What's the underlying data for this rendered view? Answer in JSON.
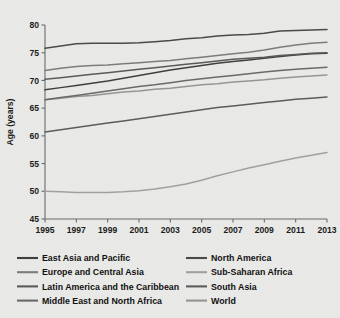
{
  "chart_data": {
    "type": "line",
    "title": "",
    "subtitle": "",
    "xlabel": "",
    "ylabel": "Age (years)",
    "xlim": [
      1995,
      2013
    ],
    "ylim": [
      45,
      80
    ],
    "y_ticks": [
      45,
      50,
      55,
      60,
      65,
      70,
      75,
      80
    ],
    "x_ticks": [
      1995,
      1996,
      1997,
      1998,
      1999,
      2000,
      2001,
      2002,
      2003,
      2004,
      2005,
      2006,
      2007,
      2008,
      2009,
      2010,
      2011,
      2012,
      2013
    ],
    "x_tick_labels": [
      "1995",
      "1997",
      "1999",
      "2001",
      "2003",
      "2005",
      "2007",
      "2009",
      "2011",
      "2013"
    ],
    "x_tick_labeled_values": [
      1995,
      1997,
      1999,
      2001,
      2003,
      2005,
      2007,
      2009,
      2011,
      2013
    ],
    "grid": false,
    "legend_position": "bottom",
    "legend_columns": 2,
    "x": [
      1995,
      1996,
      1997,
      1998,
      1999,
      2000,
      2001,
      2002,
      2003,
      2004,
      2005,
      2006,
      2007,
      2008,
      2009,
      2010,
      2011,
      2012,
      2013
    ],
    "series": [
      {
        "name": "East Asia and Pacific",
        "color": "#3f3f3f",
        "values": [
          68.3,
          68.7,
          69.1,
          69.5,
          69.9,
          70.4,
          70.9,
          71.4,
          71.9,
          72.3,
          72.7,
          73.1,
          73.4,
          73.7,
          74.0,
          74.3,
          74.6,
          74.8,
          74.9
        ]
      },
      {
        "name": "Europe and Central Asia",
        "color": "#7c7c7c",
        "values": [
          71.8,
          72.2,
          72.5,
          72.7,
          72.8,
          73.0,
          73.2,
          73.4,
          73.6,
          73.9,
          74.2,
          74.5,
          74.8,
          75.1,
          75.5,
          76.0,
          76.4,
          76.7,
          76.9
        ]
      },
      {
        "name": "Latin America and the Caribbean",
        "color": "#5a5a5a",
        "values": [
          70.2,
          70.5,
          70.8,
          71.1,
          71.4,
          71.7,
          72.0,
          72.3,
          72.6,
          72.9,
          73.2,
          73.5,
          73.8,
          74.0,
          74.2,
          74.5,
          74.7,
          74.9,
          75.0
        ]
      },
      {
        "name": "Middle East and North Africa",
        "color": "#6a6a6a",
        "values": [
          66.5,
          66.9,
          67.3,
          67.7,
          68.1,
          68.5,
          68.9,
          69.2,
          69.6,
          70.0,
          70.3,
          70.6,
          70.9,
          71.2,
          71.5,
          71.8,
          72.0,
          72.2,
          72.4
        ]
      },
      {
        "name": "North America",
        "color": "#4a4a4a",
        "values": [
          75.8,
          76.2,
          76.6,
          76.7,
          76.7,
          76.7,
          76.8,
          77.0,
          77.2,
          77.5,
          77.7,
          78.0,
          78.2,
          78.3,
          78.5,
          78.9,
          79.0,
          79.1,
          79.2
        ]
      },
      {
        "name": "Sub-Saharan Africa",
        "color": "#a0a0a0",
        "values": [
          50.0,
          49.9,
          49.8,
          49.8,
          49.8,
          49.9,
          50.1,
          50.4,
          50.8,
          51.3,
          52.0,
          52.8,
          53.5,
          54.2,
          54.8,
          55.4,
          56.0,
          56.5,
          57.0
        ]
      },
      {
        "name": "South Asia",
        "color": "#5c5c5c",
        "values": [
          60.7,
          61.1,
          61.5,
          61.9,
          62.3,
          62.7,
          63.1,
          63.5,
          63.9,
          64.3,
          64.7,
          65.1,
          65.4,
          65.7,
          66.0,
          66.3,
          66.6,
          66.8,
          67.0
        ]
      },
      {
        "name": "World",
        "color": "#959595",
        "values": [
          66.5,
          66.8,
          67.1,
          67.3,
          67.6,
          67.9,
          68.1,
          68.4,
          68.6,
          68.9,
          69.2,
          69.4,
          69.7,
          69.9,
          70.1,
          70.4,
          70.6,
          70.8,
          71.0
        ]
      }
    ],
    "legend_left_column": [
      "East Asia and Pacific",
      "Europe and Central Asia",
      "Latin America and the Caribbean",
      "Middle East and North Africa"
    ],
    "legend_right_column": [
      "North America",
      "Sub-Saharan Africa",
      "South Asia",
      "World"
    ]
  },
  "colors": {
    "background": "#e9e9e7",
    "axis": "#6b6b6b",
    "text": "#1c1c1c"
  }
}
